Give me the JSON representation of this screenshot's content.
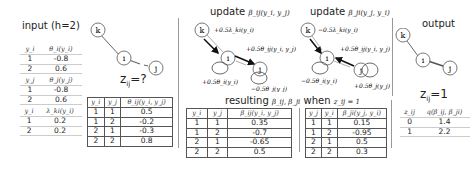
{
  "input": {
    "title": "input (h=2)",
    "theta_i": {
      "headers": [
        "y_i",
        "θ_i(y_i)"
      ],
      "rows": [
        [
          "1",
          "-0.8"
        ],
        [
          "2",
          "0.6"
        ]
      ]
    },
    "theta_j": {
      "headers": [
        "y_j",
        "θ_j(y_j)"
      ],
      "rows": [
        [
          "1",
          "-0.8"
        ],
        [
          "2",
          "0.6"
        ]
      ]
    },
    "lambda_ki": {
      "headers": [
        "y_i",
        "λ_ki(y_i)"
      ],
      "rows": [
        [
          "1",
          "0.2"
        ],
        [
          "2",
          "0.2"
        ]
      ]
    },
    "graph": {
      "nodes": [
        "k",
        "i",
        "j"
      ],
      "z_label": "z",
      "z_sub": "ij",
      "z_value": "=?"
    },
    "theta_ij": {
      "headers": [
        "y_i",
        "y_j",
        "θ_ij(y_i, y_j)"
      ],
      "rows": [
        [
          "1",
          "1",
          "0.5"
        ],
        [
          "1",
          "2",
          "-0.2"
        ],
        [
          "2",
          "1",
          "-0.3"
        ],
        [
          "2",
          "2",
          "0.8"
        ]
      ]
    }
  },
  "update": {
    "left": {
      "title_prefix": "update ",
      "title_math": "β_ij(y_i, y_j)",
      "nodes": [
        "k",
        "i",
        "j"
      ],
      "labels": {
        "ki": "+0.5λ_ki(y_i)",
        "ij": "+0.5θ_ij(y_i, y_j)",
        "i_self": "+0.5θ_i(y_i)",
        "j_self": "−0.5θ_j(y_j)"
      }
    },
    "right": {
      "title_prefix": "update ",
      "title_math": "β_ji(y_j, y_i)",
      "nodes": [
        "k",
        "i",
        "j"
      ],
      "labels": {
        "ki": "−0.5λ_ki(y_i)",
        "ij": "+0.5θ_ij(y_i, y_j)",
        "i_self": "−0.5θ_i(y_i)",
        "j_self": "+0.5θ_j(y_j)"
      }
    },
    "resulting": {
      "prefix": "resulting ",
      "math": "β_ij, β_ji",
      "mid": " when ",
      "cond": "z_ij = 1"
    },
    "beta_ij": {
      "headers": [
        "y_i",
        "y_j",
        "β_ij(y_i, y_j)"
      ],
      "rows": [
        [
          "1",
          "1",
          "0.35"
        ],
        [
          "1",
          "2",
          "-0.7"
        ],
        [
          "2",
          "1",
          "-0.65"
        ],
        [
          "2",
          "2",
          "0.5"
        ]
      ]
    },
    "beta_ji": {
      "headers": [
        "y_j",
        "y_i",
        "β_ji(y_j, y_i)"
      ],
      "rows": [
        [
          "1",
          "1",
          "0.15"
        ],
        [
          "1",
          "2",
          "-0.95"
        ],
        [
          "2",
          "1",
          "0.5"
        ],
        [
          "2",
          "2",
          "0.3"
        ]
      ]
    }
  },
  "output": {
    "title": "output",
    "nodes": [
      "k",
      "i",
      "j"
    ],
    "z_label": "z",
    "z_sub": "ij",
    "z_value": "=1",
    "q_table": {
      "headers": [
        "z_ij",
        "q(β_ij, β_ji)"
      ],
      "rows": [
        [
          "0",
          "1.4"
        ],
        [
          "1",
          "2.2"
        ]
      ]
    }
  }
}
